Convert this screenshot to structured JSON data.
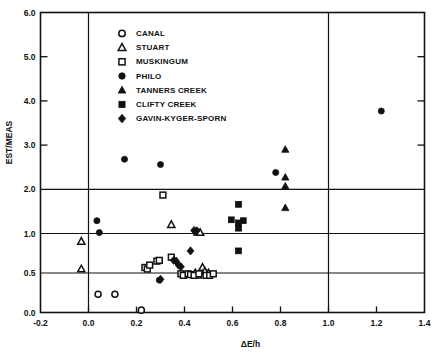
{
  "chart_data": {
    "type": "scatter",
    "title": "",
    "xlabel": "ΔE/h",
    "ylabel": "EST/MEAS",
    "xlim": [
      -0.2,
      1.4
    ],
    "ylim": [
      0.0,
      6.0
    ],
    "xticks": [
      -0.2,
      0.0,
      0.2,
      0.4,
      0.6,
      0.8,
      1.0,
      1.2,
      1.4
    ],
    "xticklabels": [
      "-0.2",
      "0.0",
      "0.2",
      "0.4",
      "0.6",
      "0.8",
      "1.0",
      "1.2",
      "1.4"
    ],
    "yticks": [
      0.0,
      0.5,
      1.0,
      2.0,
      3.0,
      4.0,
      5.0,
      6.0
    ],
    "yticklabels": [
      "0.0",
      "0.5",
      "1.0",
      "2.0",
      "3.0",
      "4.0",
      "5.0",
      "6.0"
    ],
    "y_axis_note": "piecewise scale: 0.0-1.0 expanded (0.5 steps), 1.0-6.0 compressed (1.0 steps)",
    "grid": "horizontal lines at y=0.5, 1.0, 2.0 and vertical lines at x=0.0, 1.0",
    "gridlines_x": [
      0.0,
      1.0
    ],
    "gridlines_y": [
      0.5,
      1.0,
      2.0
    ],
    "legend_position": "upper-left-inside",
    "series": [
      {
        "name": "CANAL",
        "marker": "open-circle",
        "points": [
          [
            0.04,
            0.23
          ],
          [
            0.11,
            0.23
          ],
          [
            0.22,
            0.03
          ]
        ]
      },
      {
        "name": "STUART",
        "marker": "open-triangle",
        "points": [
          [
            -0.03,
            0.9
          ],
          [
            -0.03,
            0.55
          ],
          [
            0.345,
            1.2
          ],
          [
            0.455,
            1.03
          ],
          [
            0.465,
            1.02
          ],
          [
            0.445,
            0.5
          ],
          [
            0.455,
            0.47
          ],
          [
            0.475,
            0.57
          ],
          [
            0.485,
            0.52
          ],
          [
            0.5,
            0.5
          ]
        ]
      },
      {
        "name": "MUSKINGUM",
        "marker": "open-square",
        "points": [
          [
            0.31,
            1.87
          ],
          [
            0.235,
            0.57
          ],
          [
            0.245,
            0.55
          ],
          [
            0.255,
            0.6
          ],
          [
            0.285,
            0.65
          ],
          [
            0.295,
            0.66
          ],
          [
            0.345,
            0.7
          ],
          [
            0.385,
            0.49
          ],
          [
            0.395,
            0.47
          ],
          [
            0.415,
            0.49
          ],
          [
            0.425,
            0.48
          ],
          [
            0.44,
            0.47
          ],
          [
            0.46,
            0.49
          ],
          [
            0.49,
            0.47
          ],
          [
            0.505,
            0.47
          ],
          [
            0.52,
            0.49
          ]
        ]
      },
      {
        "name": "PHILO",
        "marker": "filled-circle",
        "points": [
          [
            0.15,
            2.68
          ],
          [
            0.3,
            2.56
          ],
          [
            0.035,
            1.29
          ],
          [
            0.045,
            1.02
          ],
          [
            0.295,
            0.41
          ],
          [
            0.78,
            2.38
          ],
          [
            1.22,
            3.77
          ]
        ]
      },
      {
        "name": "TANNERS CREEK",
        "marker": "filled-triangle",
        "points": [
          [
            0.82,
            2.9
          ],
          [
            0.82,
            2.27
          ],
          [
            0.82,
            2.07
          ],
          [
            0.82,
            1.58
          ]
        ]
      },
      {
        "name": "CLIFTY CREEK",
        "marker": "filled-square",
        "points": [
          [
            0.625,
            1.66
          ],
          [
            0.595,
            1.31
          ],
          [
            0.625,
            1.24
          ],
          [
            0.645,
            1.29
          ],
          [
            0.625,
            1.12
          ],
          [
            0.625,
            0.78
          ]
        ]
      },
      {
        "name": "GAVIN-KYGER-SPORN",
        "marker": "filled-diamond",
        "points": [
          [
            0.355,
            0.66
          ],
          [
            0.365,
            0.65
          ],
          [
            0.375,
            0.6
          ],
          [
            0.385,
            0.58
          ],
          [
            0.425,
            0.78
          ],
          [
            0.44,
            1.07
          ],
          [
            0.45,
            1.06
          ],
          [
            0.3,
            0.42
          ]
        ]
      }
    ],
    "legend": [
      {
        "label": "CANAL",
        "marker": "open-circle"
      },
      {
        "label": "STUART",
        "marker": "open-triangle"
      },
      {
        "label": "MUSKINGUM",
        "marker": "open-square"
      },
      {
        "label": "PHILO",
        "marker": "filled-circle"
      },
      {
        "label": "TANNERS CREEK",
        "marker": "filled-triangle"
      },
      {
        "label": "CLIFTY CREEK",
        "marker": "filled-square"
      },
      {
        "label": "GAVIN-KYGER-SPORN",
        "marker": "filled-diamond"
      }
    ],
    "colors": {
      "ink": "#111111",
      "background": "#ffffff"
    }
  }
}
